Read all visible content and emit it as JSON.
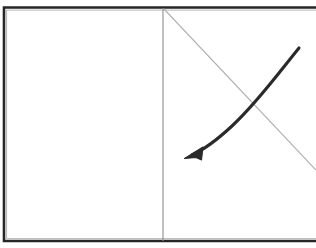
{
  "figure": {
    "kind": "line-drawing",
    "background_color": "#ffffff",
    "width": 316,
    "height": 248
  },
  "frame": {
    "name": "outer-frame",
    "color": "#262626",
    "stroke_width": 2.6,
    "left": 4,
    "top": 7.5,
    "right": 316,
    "bottom": 241,
    "right_edge_open": true
  },
  "divider": {
    "name": "vertical-divider",
    "color": "#8d8d8d",
    "stroke_width": 1.1,
    "x": 163,
    "y_top": 8,
    "y_bottom": 241
  },
  "panels": {
    "left": {
      "name": "left-panel",
      "content": "",
      "empty": true
    },
    "right": {
      "name": "right-panel",
      "empty": false
    }
  },
  "diagonal_line": {
    "name": "diagonal-line",
    "color": "#b0b0b0",
    "stroke_width": 1.1,
    "x1": 164,
    "y1": 9,
    "x2": 316,
    "y2": 170
  },
  "curved_arrow": {
    "name": "curved-arrow",
    "color": "#2a2a2a",
    "stroke_width": 3.1,
    "path": "M 299 48 C 281 70, 257 103, 232 126 C 218 139, 203 150, 192 155",
    "start_x": 299,
    "start_y": 48,
    "end_x": 192,
    "end_y": 155,
    "direction": "down-left",
    "arrowhead": {
      "name": "arrowhead",
      "tip_x": 184.5,
      "tip_y": 158.5,
      "points": "184.5,158.5 203,147 201.5,160 196,157.5",
      "color": "#2a2a2a",
      "length": 15
    }
  },
  "colors": {
    "ink_dark": "#262626",
    "ink_curve": "#2a2a2a",
    "ink_light": "#b0b0b0",
    "divider_gray": "#8d8d8d",
    "paper": "#ffffff"
  }
}
